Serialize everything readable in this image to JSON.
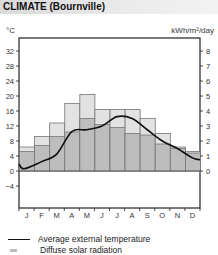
{
  "header": {
    "title": "CLIMATE (Bournville)"
  },
  "axes": {
    "left_unit": "°C",
    "right_unit": "kWh/m²/day"
  },
  "legend": {
    "items": [
      {
        "label": "Average external temperature",
        "type": "line"
      },
      {
        "label": "Diffuse solar radiation",
        "type": "swatch"
      }
    ]
  },
  "colors": {
    "diffuse": "#bdbdbd",
    "global": "#e2e2e2",
    "temperature": "#111111",
    "header": "#e4e4e4"
  },
  "chart_data": {
    "type": "bar",
    "title": "CLIMATE (Bournville)",
    "xlabel": "",
    "ylabel_left": "°C",
    "ylabel_right": "kWh/m²/day",
    "categories": [
      "J",
      "F",
      "M",
      "A",
      "M",
      "J",
      "J",
      "A",
      "S",
      "O",
      "N",
      "D"
    ],
    "left_ticks": [
      32,
      28,
      24,
      20,
      16,
      12,
      8,
      4,
      0,
      -4
    ],
    "right_ticks": [
      8,
      7,
      6,
      5,
      4,
      3,
      2,
      1,
      0
    ],
    "ylim_left": [
      -8,
      36
    ],
    "ylim_right": [
      -2,
      9
    ],
    "series": [
      {
        "name": "Global solar radiation (kWh/m²/day)",
        "type": "bar",
        "values": [
          1.6,
          2.3,
          3.2,
          4.5,
          5.1,
          4.1,
          4.1,
          4.1,
          3.5,
          2.5,
          1.6,
          1.3
        ]
      },
      {
        "name": "Diffuse solar radiation (kWh/m²/day)",
        "type": "bar",
        "values": [
          1.3,
          1.7,
          2.3,
          2.6,
          3.5,
          3.1,
          2.9,
          2.5,
          2.4,
          1.8,
          1.5,
          1.2
        ]
      },
      {
        "name": "Average external temperature (°C)",
        "type": "line",
        "values": [
          1.0,
          2.5,
          4.5,
          10.5,
          11.0,
          12.0,
          14.5,
          14.0,
          11.0,
          8.0,
          6.0,
          3.5
        ]
      }
    ],
    "grid": false,
    "legend_position": "bottom"
  }
}
